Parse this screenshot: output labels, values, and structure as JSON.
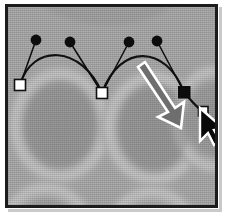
{
  "app": {
    "context": "vector-path-editing-canvas",
    "title": "Bezier path over grayscale oval pattern"
  },
  "canvas": {
    "width": 226,
    "height": 223,
    "frame": {
      "border_color": "#1c1c1c",
      "border_width": 3,
      "outer_background": "#ffffff"
    },
    "background": {
      "type": "repeating-oval-pattern",
      "base_color": "#b0b0b0",
      "oval_fill": "#a2a2a2",
      "halo_color": "#c8c8c8",
      "description": "three large soft-edged ovals with light halo rings"
    }
  },
  "ovals": [
    {
      "name": "oval-left",
      "cx": 58,
      "cy": 125,
      "rx": 52,
      "ry": 58
    },
    {
      "name": "oval-center",
      "cx": 152,
      "cy": 128,
      "rx": 52,
      "ry": 58
    },
    {
      "name": "oval-right",
      "cx": 244,
      "cy": 122,
      "rx": 52,
      "ry": 58
    },
    {
      "name": "oval-bottom-left",
      "cx": 44,
      "cy": 236,
      "rx": 52,
      "ry": 58
    },
    {
      "name": "oval-bottom-right",
      "cx": 150,
      "cy": 240,
      "rx": 52,
      "ry": 58
    }
  ],
  "path": {
    "stroke_color": "#111111",
    "stroke_width": 2.1,
    "type": "bezier-curve",
    "segments": [
      {
        "from": "anchor-1",
        "to": "anchor-2"
      },
      {
        "from": "anchor-2",
        "to": "anchor-3"
      },
      {
        "from": "anchor-3",
        "to": "anchor-4"
      }
    ]
  },
  "anchors": [
    {
      "name": "anchor-1",
      "x": 17,
      "y": 82,
      "state": "unselected",
      "style": "hollow-square",
      "fill": "#ffffff",
      "stroke": "#101010",
      "size": 11
    },
    {
      "name": "anchor-2",
      "x": 99,
      "y": 90,
      "state": "unselected",
      "style": "hollow-square",
      "fill": "#ffffff",
      "stroke": "#101010",
      "size": 11
    },
    {
      "name": "anchor-3",
      "x": 181,
      "y": 89,
      "state": "selected",
      "style": "solid-square",
      "fill": "#0d0d0d",
      "stroke": "#0d0d0d",
      "size": 11
    },
    {
      "name": "anchor-4",
      "x": 200,
      "y": 109,
      "state": "unselected",
      "style": "hollow-square",
      "fill": "#ffffff",
      "stroke": "#101010",
      "size": 9
    }
  ],
  "control_handles": [
    {
      "name": "handle-1",
      "anchor": "anchor-1",
      "dot_x": 33,
      "dot_y": 37,
      "radius": 5.2
    },
    {
      "name": "handle-2",
      "anchor": "anchor-2",
      "dot_x": 67,
      "dot_y": 39,
      "radius": 5.2
    },
    {
      "name": "handle-3",
      "anchor": "anchor-2",
      "dot_x": 127,
      "dot_y": 39,
      "radius": 5.2
    },
    {
      "name": "handle-4",
      "anchor": "anchor-3",
      "dot_x": 155,
      "dot_y": 38,
      "radius": 5.2
    }
  ],
  "annotations": {
    "drag_arrow": {
      "name": "drag-direction-arrow",
      "from_x": 142,
      "from_y": 70,
      "to_x": 178,
      "to_y": 124,
      "fill": "#6e6e6e",
      "outline": "#ffffff",
      "meaning": "drag direction indicator"
    },
    "cursor": {
      "name": "mouse-cursor",
      "x": 201,
      "y": 112,
      "fill": "#0a0a0a",
      "outline": "#ffffff",
      "shape": "arrow-pointer"
    }
  }
}
